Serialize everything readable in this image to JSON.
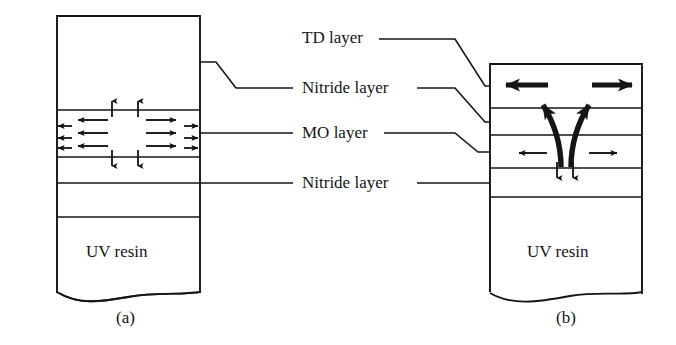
{
  "figure": {
    "width": 676,
    "height": 345,
    "background": "#ffffff",
    "line_color": "#151515",
    "text_color": "#151515"
  },
  "labels": {
    "td_layer": "TD layer",
    "nitride_layer_top": "Nitride layer",
    "mo_layer": "MO layer",
    "nitride_layer_bottom": "Nitride layer"
  },
  "panels": [
    {
      "id": "a",
      "caption": "(a)",
      "substrate_label": "UV resin",
      "layers": [
        {
          "name": "td-layer",
          "label": "TD layer"
        },
        {
          "name": "nitride-layer-top",
          "label": "Nitride layer"
        },
        {
          "name": "mo-layer",
          "label": "MO layer"
        },
        {
          "name": "nitride-layer-bottom",
          "label": "Nitride layer"
        },
        {
          "name": "uv-resin",
          "label": "UV resin"
        }
      ],
      "arrows": {
        "mo_left_group": "left-pointing in-plane magnetization arrows",
        "mo_right_group": "right-pointing in-plane magnetization arrows",
        "vertical_top": "two short up arrows at MO upper boundary",
        "vertical_bottom": "two short down arrows at MO lower boundary"
      }
    },
    {
      "id": "b",
      "caption": "(b)",
      "substrate_label": "UV resin",
      "layers": [
        {
          "name": "td-layer",
          "label": "TD layer"
        },
        {
          "name": "nitride-layer-top",
          "label": "Nitride layer"
        },
        {
          "name": "mo-layer",
          "label": "MO layer"
        },
        {
          "name": "nitride-layer-bottom",
          "label": "Nitride layer"
        },
        {
          "name": "uv-resin",
          "label": "UV resin"
        }
      ],
      "arrows": {
        "td_left": "bold left arrow in TD layer",
        "td_right": "bold right arrow in TD layer",
        "curved_left": "bold curved arrow flaring up-left from MO layer",
        "curved_right": "bold curved arrow flaring up-right from MO layer",
        "mo_left": "thin left arrow in MO layer",
        "mo_right": "thin right arrow in MO layer",
        "vertical_bottom": "two short down arrows at MO lower boundary"
      }
    }
  ],
  "captions": {
    "left": "(a)",
    "right": "(b)"
  }
}
